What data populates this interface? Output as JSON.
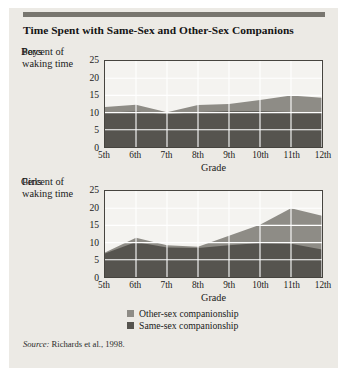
{
  "figure": {
    "title": "Time Spent with Same-Sex and Other-Sex Companions",
    "source_label": "Source:",
    "source_text": "Richards et al., 1998."
  },
  "legend": {
    "items": [
      {
        "label": "Other-sex companionship",
        "color": "#8e8c86"
      },
      {
        "label": "Same-sex companionship",
        "color": "#56544f"
      }
    ]
  },
  "axes": {
    "y_axis_title": "Percent of waking time",
    "x_axis_title": "Grade",
    "y_ticks": [
      "0",
      "5",
      "10",
      "15",
      "20",
      "25"
    ],
    "x_ticks": [
      "5th",
      "6th",
      "7th",
      "8th",
      "9th",
      "10th",
      "11th",
      "12th"
    ]
  },
  "panels": {
    "boys": {
      "label": "Boys"
    },
    "girls": {
      "label": "Girls"
    }
  },
  "chart_data": [
    {
      "type": "area",
      "title": "Boys",
      "subtitle": "Time Spent with Same-Sex and Other-Sex Companions",
      "xlabel": "Grade",
      "ylabel": "Percent of waking time",
      "categories": [
        "5th",
        "6th",
        "7th",
        "8th",
        "9th",
        "10th",
        "11th",
        "12th"
      ],
      "x_tick_labels": [
        "5th",
        "6th",
        "7th",
        "8th",
        "9th",
        "10th",
        "11th",
        "12th"
      ],
      "y_tick_labels": [
        "0",
        "5",
        "10",
        "15",
        "20",
        "25"
      ],
      "ylim": [
        0,
        25
      ],
      "y_step": 5,
      "grid": true,
      "stacked": true,
      "legend_position": "below",
      "series": [
        {
          "name": "Same-sex companionship",
          "color": "#56544f",
          "values": [
            10.0,
            10.3,
            9.5,
            10.2,
            10.4,
            10.4,
            10.2,
            10.0
          ]
        },
        {
          "name": "Other-sex companionship",
          "color": "#8e8c86",
          "values": [
            1.6,
            2.0,
            0.6,
            2.0,
            2.1,
            3.3,
            4.8,
            4.3
          ]
        }
      ],
      "totals": [
        11.6,
        12.3,
        10.1,
        12.2,
        12.5,
        13.7,
        15.0,
        14.3
      ]
    },
    {
      "type": "area",
      "title": "Girls",
      "xlabel": "Grade",
      "ylabel": "Percent of waking time",
      "categories": [
        "5th",
        "6th",
        "7th",
        "8th",
        "9th",
        "10th",
        "11th",
        "12th"
      ],
      "x_tick_labels": [
        "5th",
        "6th",
        "7th",
        "8th",
        "9th",
        "10th",
        "11th",
        "12th"
      ],
      "y_tick_labels": [
        "0",
        "5",
        "10",
        "15",
        "20",
        "25"
      ],
      "ylim": [
        0,
        25
      ],
      "y_step": 5,
      "grid": true,
      "stacked": true,
      "legend_position": "below",
      "series": [
        {
          "name": "Same-sex companionship",
          "color": "#56544f",
          "values": [
            6.8,
            10.2,
            8.6,
            8.4,
            9.2,
            9.9,
            9.7,
            8.0
          ]
        },
        {
          "name": "Other-sex companionship",
          "color": "#8e8c86",
          "values": [
            0.3,
            1.2,
            0.6,
            0.4,
            2.8,
            5.3,
            10.3,
            9.8
          ]
        }
      ],
      "totals": [
        7.1,
        11.4,
        9.2,
        8.8,
        12.0,
        15.2,
        20.0,
        17.8
      ]
    }
  ]
}
